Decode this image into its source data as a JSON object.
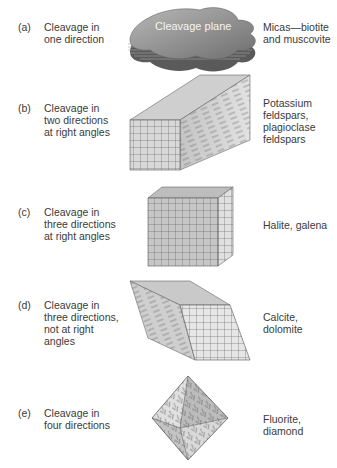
{
  "figure": {
    "rows": [
      {
        "letter": "(a)",
        "desc": [
          "Cleavage in",
          "one direction"
        ],
        "minerals": [
          "Micas—biotite",
          "and muscovite"
        ],
        "shape": "stacked-sheets",
        "shape_label": "Cleavage plane"
      },
      {
        "letter": "(b)",
        "desc": [
          "Cleavage in",
          "two directions",
          "at right angles"
        ],
        "minerals": [
          "Potassium",
          "feldspars,",
          "plagioclase",
          "feldspars"
        ],
        "shape": "rectangular-prism"
      },
      {
        "letter": "(c)",
        "desc": [
          "Cleavage in",
          "three directions",
          "at right angles"
        ],
        "minerals": [
          "Halite, galena"
        ],
        "shape": "cube"
      },
      {
        "letter": "(d)",
        "desc": [
          "Cleavage in",
          "three directions,",
          "not at right",
          "angles"
        ],
        "minerals": [
          "Calcite,",
          "dolomite"
        ],
        "shape": "rhombohedron"
      },
      {
        "letter": "(e)",
        "desc": [
          "Cleavage in",
          "four directions"
        ],
        "minerals": [
          "Fluorite,",
          "diamond"
        ],
        "shape": "octahedron"
      }
    ]
  }
}
